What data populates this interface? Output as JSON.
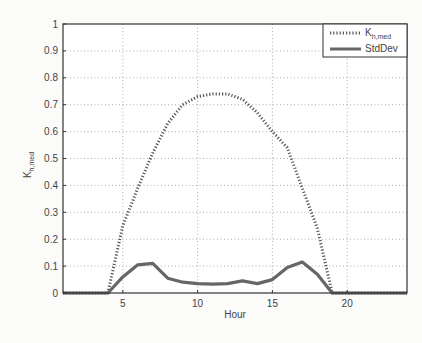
{
  "chart_data": {
    "type": "line",
    "title": "",
    "xlabel": "Hour",
    "ylabel": "K_h,med",
    "ylabel_main": "K",
    "ylabel_sub": "h,med",
    "xlim": [
      1,
      24
    ],
    "ylim": [
      0,
      1
    ],
    "xticks": [
      5,
      10,
      15,
      20
    ],
    "yticks": [
      0,
      0.1,
      0.2,
      0.3,
      0.4,
      0.5,
      0.6,
      0.7,
      0.8,
      0.9,
      1
    ],
    "ytick_labels": [
      "0",
      "0.1",
      "0.2",
      "0.3",
      "0.4",
      "0.5",
      "0.6",
      "0.7",
      "0.8",
      "0.9",
      "1"
    ],
    "grid": true,
    "legend_position": "upper right",
    "x": [
      1,
      2,
      3,
      4,
      5,
      6,
      7,
      8,
      9,
      10,
      11,
      12,
      13,
      14,
      15,
      16,
      17,
      18,
      19,
      20,
      21,
      22,
      23,
      24
    ],
    "series": [
      {
        "name": "K_h,med",
        "legend_main": "K",
        "legend_sub": "h,med",
        "style": "dotted",
        "color": "#555555",
        "values": [
          0,
          0,
          0,
          0,
          0.25,
          0.39,
          0.52,
          0.63,
          0.7,
          0.73,
          0.74,
          0.74,
          0.72,
          0.67,
          0.6,
          0.54,
          0.39,
          0.24,
          0,
          0,
          0,
          0,
          0,
          0
        ]
      },
      {
        "name": "StdDev",
        "style": "solid",
        "color": "#666666",
        "values": [
          0,
          0,
          0,
          0,
          0.06,
          0.105,
          0.11,
          0.055,
          0.04,
          0.035,
          0.033,
          0.035,
          0.045,
          0.035,
          0.05,
          0.095,
          0.115,
          0.07,
          0,
          0,
          0,
          0,
          0,
          0
        ]
      }
    ]
  }
}
